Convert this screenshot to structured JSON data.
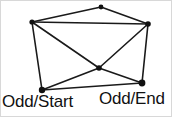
{
  "figure": {
    "kind": "graph-diagram",
    "width": 172,
    "height": 117,
    "background_color": "#ffffff",
    "border_color": "#d8d8d8",
    "edge_color": "#1a1a1a",
    "vertex_color": "#111111",
    "label_color": "#111111"
  },
  "vertices": [
    {
      "id": "top-left",
      "x": 31,
      "y": 21,
      "r": 2.6,
      "label": ""
    },
    {
      "id": "top",
      "x": 100,
      "y": 6,
      "r": 2.4,
      "label": ""
    },
    {
      "id": "top-right",
      "x": 147,
      "y": 23,
      "r": 2.8,
      "label": ""
    },
    {
      "id": "center",
      "x": 98,
      "y": 67,
      "r": 2.8,
      "label": ""
    },
    {
      "id": "bottom-left",
      "x": 41,
      "y": 89,
      "r": 3.2,
      "label": "Odd/Start"
    },
    {
      "id": "bottom-right",
      "x": 141,
      "y": 82,
      "r": 3.4,
      "label": "Odd/End"
    }
  ],
  "edges": [
    {
      "id": "e1",
      "from": "top-left",
      "to": "top"
    },
    {
      "id": "e2",
      "from": "top",
      "to": "top-right"
    },
    {
      "id": "e3",
      "from": "top-left",
      "to": "top-right"
    },
    {
      "id": "e4",
      "from": "top-left",
      "to": "bottom-left"
    },
    {
      "id": "e5",
      "from": "top-left",
      "to": "center"
    },
    {
      "id": "e6",
      "from": "top-right",
      "to": "center"
    },
    {
      "id": "e7",
      "from": "top-right",
      "to": "bottom-right"
    },
    {
      "id": "e8",
      "from": "center",
      "to": "bottom-left"
    },
    {
      "id": "e9",
      "from": "center",
      "to": "bottom-right"
    },
    {
      "id": "e10",
      "from": "bottom-left",
      "to": "bottom-right"
    }
  ],
  "labels": {
    "odd_start": "Odd/Start",
    "odd_end": "Odd/End"
  }
}
